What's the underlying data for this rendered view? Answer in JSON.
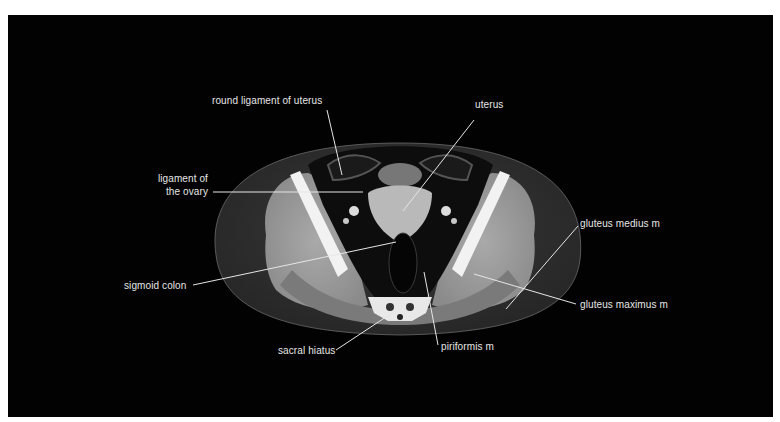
{
  "figure": {
    "type": "axial CT image of female pelvis",
    "background_color": "#020202",
    "label_color": "#e6e6e6"
  },
  "labels": {
    "round_ligament": "round ligament of uterus",
    "uterus": "uterus",
    "gluteus_medius": "gluteus medius m",
    "ligament_ovary_line1": "ligament of",
    "ligament_ovary_line2": "the ovary",
    "sigmoid_colon": "sigmoid colon",
    "gluteus_maximus": "gluteus maximus m",
    "sacral_hiatus": "sacral hiatus",
    "piriformis": "piriformis m"
  }
}
